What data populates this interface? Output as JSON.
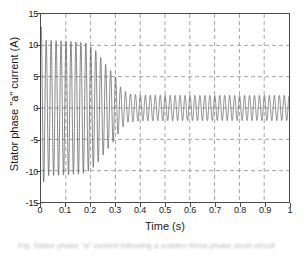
{
  "figure": {
    "caption": "Fig. Stator phase \"a\" current following a sudden three-phase short circuit",
    "background_color": "#ffffff"
  },
  "chart_data": {
    "type": "line",
    "title": "",
    "subtitle": "",
    "xlabel": "Time (s)",
    "ylabel": "Stator phase \"a\" current (A)",
    "xlim": [
      0,
      1
    ],
    "ylim": [
      -15,
      15
    ],
    "xticks": [
      0,
      0.1,
      0.2,
      0.3,
      0.4,
      0.5,
      0.6,
      0.7,
      0.8,
      0.9,
      1
    ],
    "xtick_labels": [
      "0",
      "0.1",
      "0.2",
      "0.3",
      "0.4",
      "0.5",
      "0.6",
      "0.7",
      "0.8",
      "0.9",
      "1"
    ],
    "yticks": [
      -15,
      -10,
      -5,
      0,
      5,
      10,
      15
    ],
    "ytick_labels": [
      "-15",
      "-10",
      "-5",
      "0",
      "5",
      "10",
      "15"
    ],
    "grid": true,
    "grid_style": "dashed",
    "grid_color": "#8d8d8d",
    "legend": null,
    "legend_position": "none",
    "line_color": "#555555",
    "line_width": 0.7,
    "axis_color": "#4a4a4a",
    "series": [
      {
        "name": "Stator phase a current",
        "description": "Damped sinusoidal AC current. Starts with an initial peak near +13 A at t=0, oscillates with a roughly constant envelope of about +/-10.5 A from t=0 to t=0.2 s, decays between t=0.2 s and t=0.3 s, then drops to a steady-state envelope of about +/-2 A from t=0.35 s to t=1 s.",
        "frequency_hz": 50,
        "envelope_points": [
          {
            "t": 0.0,
            "amplitude": 13.0
          },
          {
            "t": 0.02,
            "amplitude": 10.8
          },
          {
            "t": 0.1,
            "amplitude": 10.7
          },
          {
            "t": 0.18,
            "amplitude": 10.4
          },
          {
            "t": 0.22,
            "amplitude": 9.2
          },
          {
            "t": 0.26,
            "amplitude": 7.0
          },
          {
            "t": 0.3,
            "amplitude": 5.0
          },
          {
            "t": 0.32,
            "amplitude": 3.4
          },
          {
            "t": 0.35,
            "amplitude": 2.3
          },
          {
            "t": 0.4,
            "amplitude": 2.05
          },
          {
            "t": 0.6,
            "amplitude": 2.0
          },
          {
            "t": 0.8,
            "amplitude": 2.0
          },
          {
            "t": 1.0,
            "amplitude": 2.0
          }
        ],
        "peak_initial": 13.0,
        "steady_state_amplitude": 2.0,
        "transition_time": 0.3
      }
    ]
  }
}
